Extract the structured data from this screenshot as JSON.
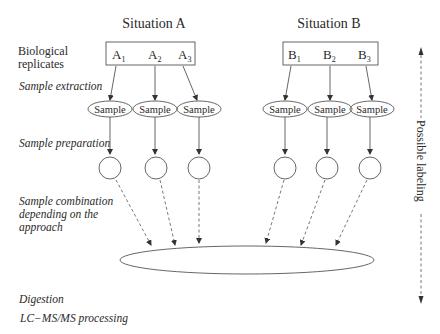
{
  "situations": [
    {
      "title": "Situation A",
      "replicates": [
        {
          "letter": "A",
          "index": "1"
        },
        {
          "letter": "A",
          "index": "2"
        },
        {
          "letter": "A",
          "index": "3"
        }
      ]
    },
    {
      "title": "Situation B",
      "replicates": [
        {
          "letter": "B",
          "index": "1"
        },
        {
          "letter": "B",
          "index": "2"
        },
        {
          "letter": "B",
          "index": "3"
        }
      ]
    }
  ],
  "sample_label": "Sample",
  "steps": {
    "biological_replicates_line1": "Biological",
    "biological_replicates_line2": "replicates",
    "sample_extraction": "Sample extraction",
    "sample_preparation": "Sample preparation",
    "sample_combination_line1": "Sample combination",
    "sample_combination_line2": "depending on the",
    "sample_combination_line3": "approach",
    "digestion": "Digestion",
    "lcms": "LC−MS/MS processing"
  },
  "side_label": "Possible labeling",
  "colors": {
    "line": "#555555",
    "text": "#2a2a2a",
    "background": "#ffffff"
  }
}
